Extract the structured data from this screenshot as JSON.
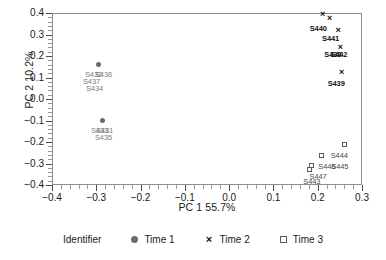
{
  "chart_data": {
    "type": "scatter",
    "title": "",
    "xlabel": "PC 1 55.7%",
    "ylabel": "PC 2 10.2%",
    "xlim": [
      -0.4,
      0.3
    ],
    "ylim": [
      -0.4,
      0.4
    ],
    "xticks": [
      "-0.4",
      "-0.3",
      "-0.2",
      "-0.1",
      "0.0",
      "0.1",
      "0.2",
      "0.3"
    ],
    "xtick_values": [
      -0.4,
      -0.3,
      -0.2,
      -0.1,
      0.0,
      0.1,
      0.2,
      0.3
    ],
    "yticks": [
      "0.4",
      "0.3",
      "0.2",
      "0.1",
      "0.0",
      "-0.1",
      "-0.2",
      "-0.3",
      "-0.4"
    ],
    "ytick_values": [
      0.4,
      0.3,
      0.2,
      0.1,
      0.0,
      -0.1,
      -0.2,
      -0.3,
      -0.4
    ],
    "grid": false,
    "legend_position": "bottom",
    "legend_title": "Identifier",
    "series": [
      {
        "name": "Time 1",
        "marker": "filled-circle",
        "color": "#6b6b6b",
        "points": [
          {
            "label": "S436",
            "x": -0.294,
            "y": 0.161,
            "label_dx": -4,
            "label_dy": 7
          },
          {
            "label": "S432",
            "x": -0.294,
            "y": 0.161,
            "label_dx": -14,
            "label_dy": 7
          },
          {
            "label": "S437",
            "x": -0.294,
            "y": 0.161,
            "label_dx": -16,
            "label_dy": 14
          },
          {
            "label": "S434",
            "x": -0.294,
            "y": 0.161,
            "label_dx": -13,
            "label_dy": 21
          },
          {
            "label": "S433",
            "x": -0.285,
            "y": -0.098,
            "label_dx": -12,
            "label_dy": 7
          },
          {
            "label": "S431",
            "x": -0.285,
            "y": -0.098,
            "label_dx": -7,
            "label_dy": 7
          },
          {
            "label": "S435",
            "x": -0.285,
            "y": -0.098,
            "label_dx": -8,
            "label_dy": 14
          }
        ]
      },
      {
        "name": "Time 2",
        "marker": "cross",
        "color": "#111111",
        "points": [
          {
            "label": "",
            "x": 0.211,
            "y": 0.395,
            "label_dx": 0,
            "label_dy": 0
          },
          {
            "label": "S440",
            "x": 0.227,
            "y": 0.374,
            "label_dx": -20,
            "label_dy": 6
          },
          {
            "label": "S441",
            "x": 0.246,
            "y": 0.318,
            "label_dx": -16,
            "label_dy": 4
          },
          {
            "label": "S438",
            "x": 0.251,
            "y": 0.241,
            "label_dx": -16,
            "label_dy": 4
          },
          {
            "label": "S442",
            "x": 0.251,
            "y": 0.241,
            "label_dx": -10,
            "label_dy": 4
          },
          {
            "label": "S439",
            "x": 0.254,
            "y": 0.123,
            "label_dx": -14,
            "label_dy": 7
          }
        ]
      },
      {
        "name": "Time 3",
        "marker": "open-square",
        "color": "#5a5a5a",
        "points": [
          {
            "label": "S444",
            "x": 0.261,
            "y": -0.211,
            "label_dx": -14,
            "label_dy": 8
          },
          {
            "label": "S446",
            "x": 0.208,
            "y": -0.262,
            "label_dx": -3,
            "label_dy": 8
          },
          {
            "label": "S445",
            "x": 0.208,
            "y": -0.262,
            "label_dx": 10,
            "label_dy": 8
          },
          {
            "label": "S447",
            "x": 0.186,
            "y": -0.31,
            "label_dx": -2,
            "label_dy": 7
          },
          {
            "label": "S443",
            "x": 0.181,
            "y": -0.329,
            "label_dx": -6,
            "label_dy": 8
          }
        ]
      }
    ]
  },
  "legend": {
    "title": "Identifier",
    "entries": [
      {
        "label": "Time 1",
        "marker": "filled-circle"
      },
      {
        "label": "Time 2",
        "marker": "cross"
      },
      {
        "label": "Time 3",
        "marker": "open-square"
      }
    ]
  },
  "markers": {
    "cross_glyph": "×"
  }
}
